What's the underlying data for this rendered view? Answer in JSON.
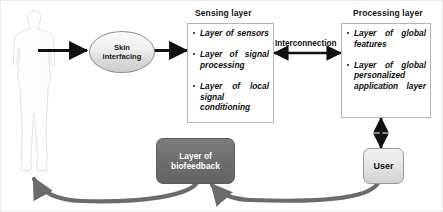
{
  "diagram": {
    "title_hidden": "Wearable biofeedback system architecture",
    "human_figure": {
      "name": "human-body-silhouette",
      "fill": "#ffffff",
      "stroke": "#d8d8d8"
    },
    "skin_node": {
      "label_line1": "Skin",
      "label_line2": "interfacing"
    },
    "sensing_layer": {
      "title": "Sensing layer",
      "items": [
        "Layer of sensors",
        "Layer of signal processing",
        "Layer of local signal conditioning"
      ]
    },
    "interconnection": {
      "label": "Interconnection"
    },
    "processing_layer": {
      "title": "Processing layer",
      "items": [
        "Layer of global features",
        "Layer of global personalized application layer"
      ]
    },
    "biofeedback_node": {
      "label_line1": "Layer of",
      "label_line2": "biofeedback"
    },
    "user_node": {
      "label": "User"
    },
    "colors": {
      "box_border": "#b3b3b3",
      "arrow_black": "#111111",
      "arrow_gray": "#6b6b6b",
      "biofeedback_fill": "#6e6e6e",
      "user_fill": "#e4e4e4",
      "skin_fill": "#e3e3e3",
      "frame": "#eceaea"
    }
  }
}
